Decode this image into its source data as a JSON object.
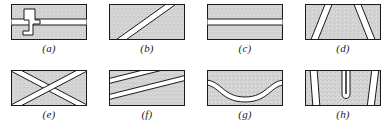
{
  "figure": {
    "type": "technical-illustration",
    "rows": 2,
    "columns": 4,
    "background_color": "#ffffff",
    "plate_fill_color": "#d2d2d2",
    "plate_border_color": "#1a1a1a",
    "weld_fill_color": "#ffffff",
    "weld_line_color": "#1a1a1a",
    "label_color": "#1a1a1a"
  },
  "panels": [
    {
      "id": "a",
      "label": "(a)",
      "row": 0,
      "column": 0,
      "description": "horizontal butt seam with a Z-shaped stepped weld crossing it",
      "features": [
        "horizontal-seam",
        "z-shaped-weld"
      ]
    },
    {
      "id": "b",
      "label": "(b)",
      "row": 0,
      "column": 1,
      "description": "single steep diagonal weld band from lower-left to upper-right",
      "features": [
        "diagonal-weld"
      ]
    },
    {
      "id": "c",
      "label": "(c)",
      "row": 0,
      "column": 2,
      "description": "plain straight horizontal weld band across the plate",
      "features": [
        "horizontal-weld"
      ]
    },
    {
      "id": "d",
      "label": "(d)",
      "row": 0,
      "column": 3,
      "description": "two inward-slanting diagonal weld bands forming a V arrangement",
      "features": [
        "double-diagonal-weld",
        "converging"
      ]
    },
    {
      "id": "e",
      "label": "(e)",
      "row": 1,
      "column": 0,
      "description": "two crossing diagonal weld bands forming an X",
      "features": [
        "crossing-welds",
        "x-pattern"
      ]
    },
    {
      "id": "f",
      "label": "(f)",
      "row": 1,
      "column": 1,
      "description": "two parallel shallow diagonal weld bands",
      "features": [
        "parallel-diagonal-welds"
      ]
    },
    {
      "id": "g",
      "label": "(g)",
      "row": 1,
      "column": 2,
      "description": "single curved S-shaped weld band dipping through the middle",
      "features": [
        "curved-weld",
        "sinusoidal"
      ]
    },
    {
      "id": "h",
      "label": "(h)",
      "row": 1,
      "column": 3,
      "description": "two edge diagonal weld bands with a narrow U-shaped hook weld between them",
      "features": [
        "double-diagonal-weld",
        "u-shaped-weld"
      ]
    }
  ]
}
